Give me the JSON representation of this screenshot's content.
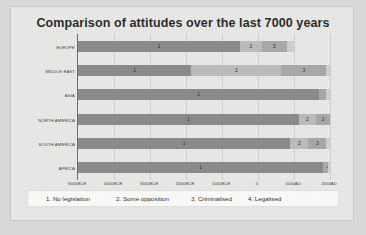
{
  "slide": {
    "title": "Comparison of attitudes over the last 7000 years"
  },
  "legend": {
    "items": [
      "1.   No legislation",
      "2. Some opposition",
      "3. Criminalised",
      "4. Legalised"
    ]
  },
  "axis": {
    "ticks": [
      "5000BCE",
      "4000BCE",
      "3000BCE",
      "2000BCE",
      "1000BCE",
      "0",
      "1000AD",
      "2000AD"
    ]
  },
  "chart_data": {
    "type": "bar",
    "title": "Comparison of attitudes over the last 7000 years",
    "xlabel": "",
    "ylabel": "",
    "orientation": "horizontal",
    "stacked": true,
    "grid": true,
    "legend_position": "bottom",
    "xlim": [
      -5000,
      2000
    ],
    "xtick_labels": [
      "5000BCE",
      "4000BCE",
      "3000BCE",
      "2000BCE",
      "1000BCE",
      "0",
      "1000AD",
      "2000AD"
    ],
    "xtick_values": [
      -5000,
      -4000,
      -3000,
      -2000,
      -1000,
      0,
      1000,
      2000
    ],
    "categories": [
      "EUROPE",
      "MIDDLE EAST",
      "ASIA",
      "NORTH AMERICA",
      "SOUTH AMERICA",
      "AFRICA"
    ],
    "series": [
      {
        "name": "1. No legislation",
        "color": "#8a8a8a",
        "values": [
          5500,
          3150,
          6700,
          6150,
          5900,
          6800
        ]
      },
      {
        "name": "2. Some opposition",
        "color": "#bcbcbc",
        "values": [
          600,
          2500,
          0,
          450,
          500,
          0
        ]
      },
      {
        "name": "3. Criminalised",
        "color": "#a8a8a8",
        "values": [
          700,
          1250,
          200,
          400,
          500,
          150
        ]
      },
      {
        "name": "4. Legalised",
        "color": "#cfcfcf",
        "values": [
          200,
          100,
          100,
          0,
          100,
          50
        ]
      }
    ],
    "bars": [
      {
        "category": "EUROPE",
        "segments": [
          {
            "label": "1",
            "start": -5000,
            "end": -500
          },
          {
            "label": "2",
            "start": -500,
            "end": 100
          },
          {
            "label": "3",
            "start": 100,
            "end": 800
          },
          {
            "label": "4",
            "start": 800,
            "end": 1000
          }
        ]
      },
      {
        "category": "MIDDLE EAST",
        "segments": [
          {
            "label": "1",
            "start": -5000,
            "end": -1850
          },
          {
            "label": "2",
            "start": -1850,
            "end": 650
          },
          {
            "label": "3",
            "start": 650,
            "end": 1900
          },
          {
            "label": "4",
            "start": 1900,
            "end": 2000
          }
        ]
      },
      {
        "category": "ASIA",
        "segments": [
          {
            "label": "1",
            "start": -5000,
            "end": 1700
          },
          {
            "label": "3",
            "start": 1700,
            "end": 1900
          },
          {
            "label": "4",
            "start": 1900,
            "end": 2000
          }
        ]
      },
      {
        "category": "NORTH AMERICA",
        "segments": [
          {
            "label": "1",
            "start": -5000,
            "end": 1150
          },
          {
            "label": "2",
            "start": 1150,
            "end": 1600
          },
          {
            "label": "3",
            "start": 1600,
            "end": 2000
          }
        ]
      },
      {
        "category": "SOUTH AMERICA",
        "segments": [
          {
            "label": "1",
            "start": -5000,
            "end": 900
          },
          {
            "label": "2",
            "start": 900,
            "end": 1400
          },
          {
            "label": "3",
            "start": 1400,
            "end": 1900
          },
          {
            "label": "4",
            "start": 1900,
            "end": 2000
          }
        ]
      },
      {
        "category": "AFRICA",
        "segments": [
          {
            "label": "1",
            "start": -5000,
            "end": 1800
          },
          {
            "label": "3",
            "start": 1800,
            "end": 1950
          },
          {
            "label": "4",
            "start": 1950,
            "end": 2000
          }
        ]
      }
    ]
  }
}
